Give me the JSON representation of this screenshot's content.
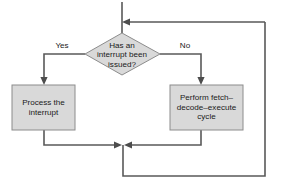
{
  "diagram": {
    "type": "flowchart",
    "colors": {
      "shape_fill": "#d9d9d9",
      "shape_stroke": "#8c8c8c",
      "connector": "#595959",
      "background": "#ffffff",
      "text": "#1a1a1a"
    },
    "decision": {
      "shape": "diamond",
      "lines": [
        "Has an",
        "interrupt been",
        "issued?"
      ]
    },
    "process_left": {
      "shape": "rectangle",
      "lines": [
        "Process the",
        "interrupt"
      ]
    },
    "process_right": {
      "shape": "rectangle",
      "lines": [
        "Perform fetch–",
        "decode–execute",
        "cycle"
      ]
    },
    "branches": {
      "yes_label": "Yes",
      "no_label": "No"
    }
  }
}
